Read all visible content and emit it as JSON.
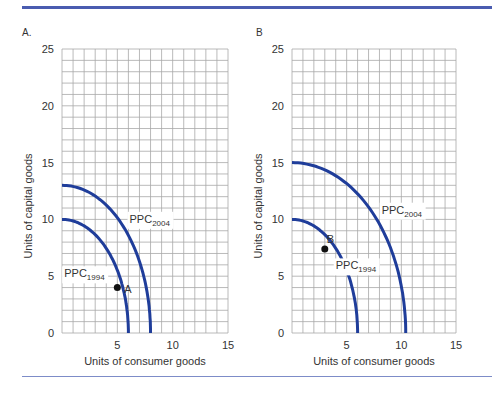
{
  "chart_data": [
    {
      "type": "line",
      "panel_label": "A.",
      "title": "",
      "xlabel": "Units of consumer goods",
      "ylabel": "Units of capital goods",
      "xlim": [
        0,
        15
      ],
      "ylim": [
        0,
        25
      ],
      "xticks": [
        5,
        10,
        15
      ],
      "yticks": [
        0,
        5,
        10,
        15,
        20,
        25
      ],
      "grid": true,
      "grid_step": 1,
      "series": [
        {
          "name": "PPC1994",
          "label_main": "PPC",
          "label_sub": "1994",
          "y_intercept": 10,
          "x_intercept": 6
        },
        {
          "name": "PPC2004",
          "label_main": "PPC",
          "label_sub": "2004",
          "y_intercept": 13,
          "x_intercept": 8
        }
      ],
      "points": [
        {
          "label": "A",
          "x": 5,
          "y": 4
        }
      ],
      "color": "#1f3d9a"
    },
    {
      "type": "line",
      "panel_label": "B",
      "title": "",
      "xlabel": "Units of consumer goods",
      "ylabel": "Units of capital goods",
      "xlim": [
        0,
        15
      ],
      "ylim": [
        0,
        25
      ],
      "xticks": [
        5,
        10,
        15
      ],
      "yticks": [
        0,
        5,
        10,
        15,
        20,
        25
      ],
      "grid": true,
      "grid_step": 1,
      "series": [
        {
          "name": "PPC1994",
          "label_main": "PPC",
          "label_sub": "1994",
          "y_intercept": 10,
          "x_intercept": 6
        },
        {
          "name": "PPC2004",
          "label_main": "PPC",
          "label_sub": "2004",
          "y_intercept": 15,
          "x_intercept": 10.4
        }
      ],
      "points": [
        {
          "label": "B",
          "x": 3,
          "y": 7.4
        }
      ],
      "color": "#1f3d9a"
    }
  ]
}
